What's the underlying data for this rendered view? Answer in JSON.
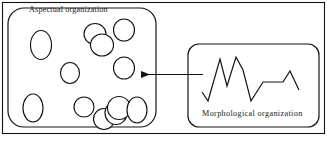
{
  "figure": {
    "type": "conceptual-diagram",
    "background_color": "#ffffff",
    "stroke_color": "#141414",
    "outer_frame": {
      "name": "outer-frame",
      "x": 2.5,
      "y": 2.5,
      "width": 322,
      "height": 131,
      "stroke_width": 1.1
    },
    "panels": [
      {
        "id": "aspectual",
        "label": "Aspectual organization",
        "label_x": 29,
        "label_y": 6,
        "font_size": 8.2,
        "box": {
          "x": 8,
          "y": 8,
          "width": 148,
          "height": 119,
          "radius": 16,
          "stroke_width": 1.2
        },
        "content_kind": "scattered-ellipses"
      },
      {
        "id": "morphological",
        "label": "Morphological organization",
        "label_x": 202,
        "label_y": 110,
        "font_size": 8.2,
        "box": {
          "x": 188,
          "y": 44,
          "width": 131,
          "height": 83,
          "radius": 11,
          "stroke_width": 1.2
        },
        "content_kind": "zigzag-waveform"
      }
    ],
    "arrow": {
      "name": "leftward-arrow",
      "direction": "left",
      "x1": 203,
      "y1": 74.5,
      "x2": 141,
      "y2": 74.5,
      "head_length": 9,
      "head_width": 6,
      "stroke_width": 1.2
    },
    "ellipses": [
      {
        "cx": 41,
        "cy": 45,
        "rx": 10.5,
        "ry": 14.5
      },
      {
        "cx": 95,
        "cy": 34,
        "rx": 11,
        "ry": 10.5
      },
      {
        "cx": 102,
        "cy": 45,
        "rx": 11.5,
        "ry": 11
      },
      {
        "cx": 124,
        "cy": 30,
        "rx": 10.5,
        "ry": 11
      },
      {
        "cx": 70,
        "cy": 73,
        "rx": 9.5,
        "ry": 10.5
      },
      {
        "cx": 124,
        "cy": 68,
        "rx": 10.5,
        "ry": 11
      },
      {
        "cx": 33,
        "cy": 108,
        "rx": 10,
        "ry": 14
      },
      {
        "cx": 84,
        "cy": 107,
        "rx": 10,
        "ry": 10
      },
      {
        "cx": 104,
        "cy": 119,
        "rx": 10.5,
        "ry": 10.5
      },
      {
        "cx": 116,
        "cy": 113,
        "rx": 11,
        "ry": 11.5
      },
      {
        "cx": 119,
        "cy": 108,
        "rx": 11.5,
        "ry": 11.5
      },
      {
        "cx": 137,
        "cy": 110,
        "rx": 10,
        "ry": 13
      }
    ],
    "zigzag": {
      "name": "waveform-polyline",
      "stroke_width": 1.2,
      "points": [
        {
          "x": 202,
          "y": 92
        },
        {
          "x": 208,
          "y": 101
        },
        {
          "x": 220,
          "y": 59
        },
        {
          "x": 227,
          "y": 86
        },
        {
          "x": 236,
          "y": 57
        },
        {
          "x": 243,
          "y": 70
        },
        {
          "x": 251,
          "y": 101
        },
        {
          "x": 263,
          "y": 82
        },
        {
          "x": 283,
          "y": 82
        },
        {
          "x": 290,
          "y": 71
        },
        {
          "x": 299,
          "y": 90
        }
      ]
    }
  }
}
